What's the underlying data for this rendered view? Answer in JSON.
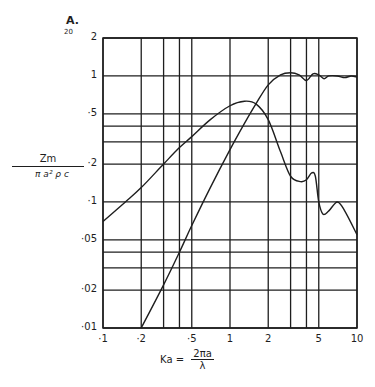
{
  "figure": {
    "panel_label": "A.",
    "panel_sublabel": "20"
  },
  "chart_data": {
    "type": "line",
    "title": "",
    "xscale": "log",
    "yscale": "log",
    "xlabel_main": "Ka =",
    "xlabel_numerator": "2πa",
    "xlabel_denominator": "λ",
    "ylabel_numerator": "Zm",
    "ylabel_denominator": "π a² ρ c",
    "xlim": [
      0.1,
      10
    ],
    "ylim": [
      0.01,
      2
    ],
    "grid": true,
    "x_ticks": [
      0.1,
      0.2,
      0.5,
      1,
      2,
      5,
      10
    ],
    "x_tick_labels": [
      "·1",
      "·2",
      "·5",
      "1",
      "2",
      "5",
      "10"
    ],
    "x_gridlines": [
      0.1,
      0.2,
      0.3,
      0.4,
      0.5,
      1,
      2,
      3,
      4,
      5,
      10
    ],
    "y_ticks": [
      0.01,
      0.02,
      0.05,
      0.1,
      0.2,
      0.5,
      1,
      2
    ],
    "y_tick_labels": [
      "·01",
      "·02",
      "·05",
      "·1",
      "·2",
      "·5",
      "1",
      "2"
    ],
    "y_gridlines": [
      0.01,
      0.02,
      0.03,
      0.04,
      0.05,
      0.1,
      0.2,
      0.3,
      0.4,
      0.5,
      1,
      2
    ],
    "series": [
      {
        "name": "reactance (peaked curve)",
        "x": [
          0.1,
          0.15,
          0.2,
          0.3,
          0.4,
          0.5,
          0.7,
          1.0,
          1.3,
          1.6,
          2.0,
          2.5,
          3.0,
          3.6,
          4.0,
          4.4,
          4.7,
          5.0,
          5.4,
          6.0,
          7.0,
          8.0,
          10.0
        ],
        "y": [
          0.07,
          0.1,
          0.13,
          0.2,
          0.27,
          0.33,
          0.45,
          0.58,
          0.63,
          0.6,
          0.45,
          0.25,
          0.16,
          0.145,
          0.15,
          0.17,
          0.16,
          0.1,
          0.08,
          0.085,
          0.1,
          0.085,
          0.055
        ]
      },
      {
        "name": "resistance (rising curve)",
        "x": [
          0.2,
          0.3,
          0.4,
          0.5,
          0.7,
          1.0,
          1.3,
          1.6,
          2.0,
          2.5,
          3.0,
          3.5,
          4.0,
          4.5,
          5.0,
          5.5,
          6.0,
          7.0,
          8.0,
          9.0,
          10.0
        ],
        "y": [
          0.01,
          0.022,
          0.04,
          0.065,
          0.13,
          0.26,
          0.42,
          0.6,
          0.85,
          1.02,
          1.06,
          1.02,
          0.92,
          1.04,
          1.02,
          0.95,
          1.0,
          1.0,
          0.97,
          1.0,
          0.98
        ]
      }
    ]
  },
  "colors": {
    "ink": "#1e1e1e",
    "paper": "#ffffff"
  }
}
